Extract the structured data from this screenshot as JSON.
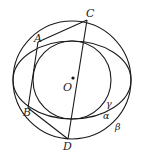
{
  "figure": {
    "width": 143,
    "height": 160,
    "stroke_color": "#1a1a1a",
    "background": "#ffffff"
  },
  "curves": {
    "beta": {
      "type": "circle",
      "label": "β",
      "cx": 72,
      "cy": 80,
      "r": 59
    },
    "alpha": {
      "type": "ellipse",
      "label": "α",
      "cx": 72,
      "cy": 80,
      "rx": 59,
      "ry": 39
    },
    "gamma": {
      "type": "circle",
      "label": "γ",
      "cx": 72,
      "cy": 80,
      "r": 39
    }
  },
  "points": {
    "A": {
      "label": "A",
      "x": 38,
      "y": 42
    },
    "B": {
      "label": "B",
      "x": 28,
      "y": 108
    },
    "C": {
      "label": "C",
      "x": 87,
      "y": 20
    },
    "D": {
      "label": "D",
      "x": 68,
      "y": 139
    },
    "O": {
      "label": "O",
      "x": 73,
      "y": 78
    }
  },
  "segments": [
    {
      "from": "A",
      "to": "C"
    },
    {
      "from": "C",
      "to": "D"
    },
    {
      "from": "A",
      "to": "B"
    },
    {
      "from": "B",
      "to": "D"
    }
  ],
  "labels": {
    "A": "A",
    "B": "B",
    "C": "C",
    "D": "D",
    "O": "O",
    "alpha": "α",
    "beta": "β",
    "gamma": "γ"
  }
}
